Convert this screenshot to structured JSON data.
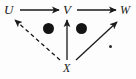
{
  "figure": {
    "kind": "commutative-diagram",
    "background_color": "#fdfdfd",
    "ink_color": "#1a1a1a",
    "width": 136,
    "height": 79
  },
  "nodes": [
    {
      "id": "U",
      "label": "U",
      "x": 10,
      "y": 10
    },
    {
      "id": "V",
      "label": "V",
      "x": 68,
      "y": 10
    },
    {
      "id": "W",
      "label": "W",
      "x": 125,
      "y": 10
    },
    {
      "id": "X",
      "label": "X",
      "x": 68,
      "y": 68
    }
  ],
  "edges": [
    {
      "id": "u-to-v",
      "from": "U",
      "to": "V",
      "style": "solid",
      "arrowhead": "filled",
      "x1": 20,
      "y1": 10,
      "x2": 60,
      "y2": 10
    },
    {
      "id": "v-to-w",
      "from": "V",
      "to": "W",
      "style": "solid",
      "arrowhead": "filled",
      "x1": 76,
      "y1": 10,
      "x2": 116,
      "y2": 10
    },
    {
      "id": "x-to-u",
      "from": "X",
      "to": "U",
      "style": "dashed",
      "arrowhead": "filled",
      "x1": 60,
      "y1": 60,
      "x2": 13,
      "y2": 19
    },
    {
      "id": "x-to-v",
      "from": "X",
      "to": "V",
      "style": "solid",
      "arrowhead": "filled",
      "x1": 67,
      "y1": 60,
      "x2": 67,
      "y2": 19
    },
    {
      "id": "x-to-w",
      "from": "X",
      "to": "W",
      "style": "solid",
      "arrowhead": "filled",
      "x1": 76,
      "y1": 60,
      "x2": 117,
      "y2": 21
    }
  ],
  "marks": [
    {
      "id": "bullet-left",
      "shape": "filled-circle",
      "x": 48,
      "y": 28,
      "r": 5.5
    },
    {
      "id": "bullet-right",
      "shape": "filled-circle",
      "x": 81,
      "y": 28,
      "r": 5.5
    },
    {
      "id": "bullet-small",
      "shape": "filled-circle",
      "x": 110,
      "y": 46,
      "r": 1.5
    }
  ]
}
